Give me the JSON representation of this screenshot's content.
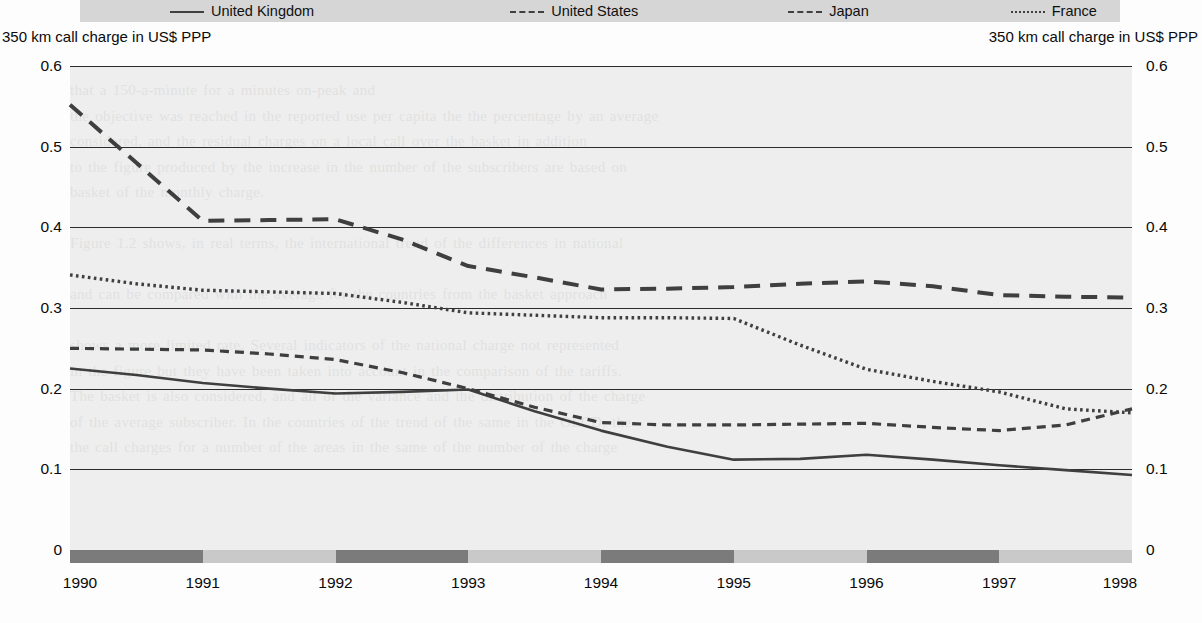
{
  "legend": {
    "items": [
      {
        "label": "United Kingdom",
        "style": "solid",
        "name": "legend-united-kingdom"
      },
      {
        "label": "United States",
        "style": "shortdash",
        "name": "legend-united-states"
      },
      {
        "label": "Japan",
        "style": "longdash",
        "name": "legend-japan"
      },
      {
        "label": "France",
        "style": "dotted",
        "name": "legend-france"
      }
    ]
  },
  "axis_captions": {
    "left": "350 km call charge in US$ PPP",
    "right": "350 km call charge in US$ PPP"
  },
  "colors": {
    "line": "#3f3f3f",
    "plot_background": "#eeeeee",
    "gridline": "#2c2c2c",
    "legend_background": "#d6d6d6",
    "band_dark": "#7b7b7b",
    "band_light": "#c9c9c9",
    "text": "#0a0a0a"
  },
  "xband": {
    "segments": [
      "dark",
      "light",
      "dark",
      "light",
      "dark",
      "light",
      "dark",
      "light"
    ]
  },
  "chart_data": {
    "type": "line",
    "title": "",
    "subtitle": "",
    "xlabel": "",
    "ylabel": "350 km call charge in US$ PPP",
    "ylabel_right": "350 km call charge in US$ PPP",
    "x": [
      1990,
      1990.5,
      1991,
      1991.5,
      1992,
      1992.5,
      1993,
      1993.5,
      1994,
      1994.5,
      1995,
      1995.5,
      1996,
      1996.5,
      1997,
      1997.5,
      1998
    ],
    "xlim": [
      1990,
      1998
    ],
    "ylim": [
      0,
      0.6
    ],
    "yticks": [
      0,
      0.1,
      0.2,
      0.3,
      0.4,
      0.5,
      0.6
    ],
    "ytick_labels": [
      "0",
      "0.1",
      "0.2",
      "0.3",
      "0.4",
      "0.5",
      "0.6"
    ],
    "xticks": [
      1990,
      1991,
      1992,
      1993,
      1994,
      1995,
      1996,
      1997,
      1998
    ],
    "xtick_labels": [
      "1990",
      "1991",
      "1992",
      "1993",
      "1994",
      "1995",
      "1996",
      "1997",
      "1998"
    ],
    "grid": true,
    "grid_axis": "y",
    "legend_position": "top",
    "series": [
      {
        "name": "United Kingdom",
        "style": "solid",
        "values": [
          0.225,
          0.217,
          0.207,
          0.2,
          0.194,
          0.196,
          0.199,
          0.172,
          0.148,
          0.128,
          0.112,
          0.113,
          0.118,
          0.112,
          0.105,
          0.099,
          0.093
        ]
      },
      {
        "name": "United States",
        "style": "shortdash",
        "values": [
          0.25,
          0.249,
          0.248,
          0.243,
          0.236,
          0.22,
          0.2,
          0.177,
          0.158,
          0.155,
          0.155,
          0.156,
          0.157,
          0.152,
          0.148,
          0.155,
          0.175
        ]
      },
      {
        "name": "Japan",
        "style": "longdash",
        "values": [
          0.552,
          0.48,
          0.408,
          0.409,
          0.41,
          0.385,
          0.352,
          0.338,
          0.323,
          0.324,
          0.326,
          0.33,
          0.333,
          0.327,
          0.316,
          0.314,
          0.313
        ]
      },
      {
        "name": "France",
        "style": "dotted",
        "values": [
          0.341,
          0.33,
          0.322,
          0.32,
          0.318,
          0.307,
          0.294,
          0.291,
          0.288,
          0.288,
          0.287,
          0.254,
          0.224,
          0.209,
          0.196,
          0.175,
          0.17
        ]
      }
    ]
  },
  "background_text": "that a 150-a-minute for a minutes on-peak and\nthe objective was reached in the reported use per capita the the percentage by an average\nconsidered, and the residual charges on a local call over the basket in addition\nto the figure produced by the increase in the number of the subscribers are based on\nbasket of the monthly charge.\n\nFigure 1.2 shows, in real terms, the international trend of the differences in national\n\nand can be compared with the average for the countries from the basket approach\n\nshows a more limited rate. Several indicators of the national charge not represented\nin the figure but they have been taken into account in the comparison of the tariffs.\nThe basket is also considered, and all of the variance and the distribution of the charge\nof the average subscriber. In the countries of the trend of the same in the OECD, the\nthe call charges for a number of the areas in the same of the number of the charge"
}
